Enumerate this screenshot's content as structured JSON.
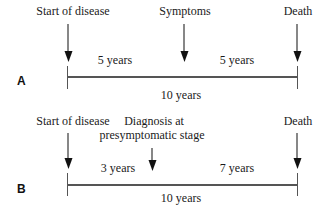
{
  "figure": {
    "colors": {
      "background": "#ffffff",
      "text": "#1a1a1a",
      "line": "#555555",
      "arrow": "#111111",
      "panel_letter": "#111111"
    },
    "panels": [
      {
        "letter": "A",
        "events": [
          {
            "label": "Start of disease"
          },
          {
            "label": "Symptoms"
          },
          {
            "label": "Death"
          }
        ],
        "intervals": [
          {
            "label": "5 years"
          },
          {
            "label": "5 years"
          }
        ],
        "total_label": "10 years"
      },
      {
        "letter": "B",
        "events": [
          {
            "label": "Start of disease"
          },
          {
            "label": "Diagnosis at",
            "label_line2": "presymptomatic stage"
          },
          {
            "label": "Death"
          }
        ],
        "intervals": [
          {
            "label": "3 years"
          },
          {
            "label": "7 years"
          }
        ],
        "total_label": "10 years"
      }
    ]
  }
}
